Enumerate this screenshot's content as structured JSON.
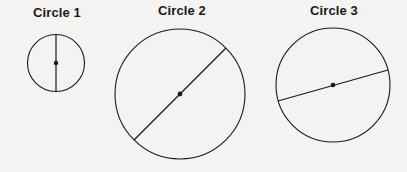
{
  "figure": {
    "background_color": "#f4f3f1",
    "stroke_color": "#1a1a1a",
    "label_color": "#191919",
    "title_font_size": 13
  },
  "circles": [
    {
      "label": "Circle 1",
      "label_x": 57,
      "label_y": 5,
      "cx": 56,
      "cy": 63,
      "r": 28.5,
      "stroke_width": 1.1,
      "center_dot_r": 2.2,
      "diameter": {
        "name": "vertical-diameter",
        "x1": 56,
        "y1": 34.5,
        "x2": 56,
        "y2": 91.5,
        "stroke_width": 1.2
      }
    },
    {
      "label": "Circle 2",
      "label_x": 182,
      "label_y": 3,
      "cx": 180,
      "cy": 94,
      "r": 65,
      "stroke_width": 1.1,
      "center_dot_r": 2.4,
      "diameter": {
        "name": "diagonal-diameter",
        "x1": 134,
        "y1": 140,
        "x2": 226,
        "y2": 48,
        "stroke_width": 1.2
      }
    },
    {
      "label": "Circle 3",
      "label_x": 334,
      "label_y": 3,
      "cx": 333,
      "cy": 85,
      "r": 57,
      "stroke_width": 1.1,
      "center_dot_r": 2.3,
      "diameter": {
        "name": "slanted-chord",
        "x1": 278,
        "y1": 101,
        "x2": 388,
        "y2": 70,
        "stroke_width": 1.2
      }
    }
  ]
}
